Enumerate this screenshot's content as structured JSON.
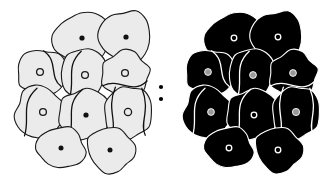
{
  "figure": {
    "width": 323,
    "height": 184,
    "background_color": "#ffffff",
    "separator": {
      "glyph": ":",
      "label": "colon-separator",
      "x": 161,
      "y": 92,
      "dot_color": "#000000",
      "dot_radius": 2.1,
      "dot_upper_y": 87,
      "dot_lower_y": 99
    }
  },
  "clusters": [
    {
      "id": "left-cluster",
      "label": "Light cell cluster",
      "style": "light",
      "cell_count": 10,
      "fill_color": "#ebebeb",
      "outline_color": "#1a1a1a",
      "outline_width": 1.1,
      "nucleus_dark_color": "#111111",
      "nucleus_gray_color": "#6e6e6e",
      "nucleus_ring_color": "#1a1a1a",
      "crease_color": "#111111",
      "crease_width": 1.3,
      "rows": [
        2,
        3,
        3,
        2
      ],
      "cells": [
        {
          "id": "L1",
          "row": 1,
          "cx": 82,
          "cy": 38,
          "rx": 28,
          "ry": 26,
          "rotation": -8,
          "seed": 11,
          "nucleus": {
            "type": "dot",
            "dx": 0,
            "dy": 0,
            "r": 2.6
          },
          "crease": null
        },
        {
          "id": "L2",
          "row": 1,
          "cx": 126,
          "cy": 37,
          "rx": 26,
          "ry": 26,
          "rotation": 14,
          "seed": 23,
          "nucleus": {
            "type": "dot",
            "dx": 0,
            "dy": 0,
            "r": 2.6
          },
          "crease": null
        },
        {
          "id": "L3",
          "row": 2,
          "cx": 41,
          "cy": 72,
          "rx": 25,
          "ry": 23,
          "rotation": -20,
          "seed": 31,
          "nucleus": {
            "type": "ring",
            "dx": -1,
            "dy": 0,
            "r": 3.4
          },
          "crease": {
            "type": "arc-right",
            "amp": 9
          }
        },
        {
          "id": "L4",
          "row": 2,
          "cx": 84,
          "cy": 75,
          "rx": 23,
          "ry": 25,
          "rotation": 6,
          "seed": 43,
          "nucleus": {
            "type": "ring",
            "dx": 1,
            "dy": 0,
            "r": 3.4
          },
          "crease": {
            "type": "arc-left",
            "amp": 8
          }
        },
        {
          "id": "L5",
          "row": 2,
          "cx": 125,
          "cy": 74,
          "rx": 24,
          "ry": 23,
          "rotation": -12,
          "seed": 57,
          "nucleus": {
            "type": "ring",
            "dx": 0,
            "dy": -1,
            "r": 3.4
          },
          "crease": {
            "type": "arc-bottom",
            "amp": 9
          }
        },
        {
          "id": "L6",
          "row": 3,
          "cx": 40,
          "cy": 113,
          "rx": 25,
          "ry": 26,
          "rotation": 10,
          "seed": 67,
          "nucleus": {
            "type": "ring",
            "dx": 3,
            "dy": -1,
            "r": 3.4
          },
          "crease": {
            "type": "arc-left",
            "amp": 11
          }
        },
        {
          "id": "L7",
          "row": 3,
          "cx": 86,
          "cy": 114,
          "rx": 27,
          "ry": 26,
          "rotation": -6,
          "seed": 73,
          "nucleus": {
            "type": "dot",
            "dx": 0,
            "dy": 1,
            "r": 2.6
          },
          "crease": {
            "type": "arc-left",
            "amp": 9
          }
        },
        {
          "id": "L8",
          "row": 3,
          "cx": 128,
          "cy": 112,
          "rx": 23,
          "ry": 27,
          "rotation": 4,
          "seed": 89,
          "nucleus": {
            "type": "ring",
            "dx": 0,
            "dy": 0,
            "r": 3.6
          },
          "crease": {
            "type": "arc-both",
            "amp": 10
          }
        },
        {
          "id": "L9",
          "row": 4,
          "cx": 61,
          "cy": 148,
          "rx": 24,
          "ry": 21,
          "rotation": -14,
          "seed": 97,
          "nucleus": {
            "type": "dot",
            "dx": 0,
            "dy": 0,
            "r": 2.5
          },
          "crease": null
        },
        {
          "id": "L10",
          "row": 4,
          "cx": 110,
          "cy": 150,
          "rx": 24,
          "ry": 22,
          "rotation": 16,
          "seed": 103,
          "nucleus": {
            "type": "dot",
            "dx": 0,
            "dy": 0,
            "r": 2.5
          },
          "crease": null
        }
      ]
    },
    {
      "id": "right-cluster",
      "label": "Dark inverted cell cluster",
      "style": "dark",
      "cell_count": 10,
      "fill_color": "#000000",
      "outline_color": "#ffffff",
      "outline_width": 1.1,
      "nucleus_dark_color": "#ffffff",
      "nucleus_gray_color": "#9a9a9a",
      "nucleus_ring_color": "#ffffff",
      "crease_color": "#ffffff",
      "crease_width": 1.3,
      "rows": [
        2,
        3,
        3,
        2
      ],
      "cells": [
        {
          "id": "R1",
          "row": 1,
          "cx": 234,
          "cy": 38,
          "rx": 28,
          "ry": 26,
          "rotation": -8,
          "seed": 11,
          "nucleus": {
            "type": "ring",
            "dx": 0,
            "dy": 0,
            "r": 2.8
          },
          "crease": null
        },
        {
          "id": "R2",
          "row": 1,
          "cx": 278,
          "cy": 37,
          "rx": 26,
          "ry": 26,
          "rotation": 14,
          "seed": 23,
          "nucleus": {
            "type": "ring",
            "dx": 0,
            "dy": 0,
            "r": 2.8
          },
          "crease": null
        },
        {
          "id": "R3",
          "row": 2,
          "cx": 209,
          "cy": 72,
          "rx": 25,
          "ry": 23,
          "rotation": -20,
          "seed": 31,
          "nucleus": {
            "type": "gray",
            "dx": -1,
            "dy": 0,
            "r": 3.4
          },
          "crease": {
            "type": "arc-right",
            "amp": 9
          }
        },
        {
          "id": "R4",
          "row": 2,
          "cx": 252,
          "cy": 75,
          "rx": 23,
          "ry": 25,
          "rotation": 6,
          "seed": 43,
          "nucleus": {
            "type": "gray",
            "dx": 1,
            "dy": 0,
            "r": 3.4
          },
          "crease": {
            "type": "arc-left",
            "amp": 8
          }
        },
        {
          "id": "R5",
          "row": 2,
          "cx": 293,
          "cy": 74,
          "rx": 24,
          "ry": 23,
          "rotation": -12,
          "seed": 57,
          "nucleus": {
            "type": "gray",
            "dx": 0,
            "dy": -1,
            "r": 3.4
          },
          "crease": {
            "type": "arc-bottom",
            "amp": 9
          }
        },
        {
          "id": "R6",
          "row": 3,
          "cx": 208,
          "cy": 113,
          "rx": 25,
          "ry": 26,
          "rotation": 10,
          "seed": 67,
          "nucleus": {
            "type": "gray",
            "dx": 3,
            "dy": -1,
            "r": 3.4
          },
          "crease": {
            "type": "arc-left",
            "amp": 11
          }
        },
        {
          "id": "R7",
          "row": 3,
          "cx": 254,
          "cy": 114,
          "rx": 27,
          "ry": 26,
          "rotation": -6,
          "seed": 73,
          "nucleus": {
            "type": "ring",
            "dx": 0,
            "dy": 1,
            "r": 2.8
          },
          "crease": {
            "type": "arc-left",
            "amp": 9
          }
        },
        {
          "id": "R8",
          "row": 3,
          "cx": 296,
          "cy": 112,
          "rx": 23,
          "ry": 27,
          "rotation": 4,
          "seed": 89,
          "nucleus": {
            "type": "gray",
            "dx": 0,
            "dy": 0,
            "r": 3.6
          },
          "crease": {
            "type": "arc-both",
            "amp": 10
          }
        },
        {
          "id": "R9",
          "row": 4,
          "cx": 229,
          "cy": 148,
          "rx": 24,
          "ry": 21,
          "rotation": -14,
          "seed": 97,
          "nucleus": {
            "type": "ring",
            "dx": 0,
            "dy": 0,
            "r": 2.8
          },
          "crease": null
        },
        {
          "id": "R10",
          "row": 4,
          "cx": 278,
          "cy": 150,
          "rx": 24,
          "ry": 22,
          "rotation": 16,
          "seed": 103,
          "nucleus": {
            "type": "ring",
            "dx": 0,
            "dy": 0,
            "r": 2.8
          },
          "crease": null
        }
      ]
    }
  ]
}
